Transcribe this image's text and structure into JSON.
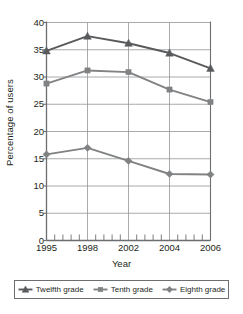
{
  "chart_data": {
    "type": "line",
    "title": "",
    "xlabel": "Year",
    "ylabel": "Percentage of users",
    "categories": [
      "1995",
      "1998",
      "2002",
      "2004",
      "2006"
    ],
    "x": [
      1995,
      1998,
      2002,
      2004,
      2006
    ],
    "xlim": [
      1995,
      2006
    ],
    "ylim": [
      0,
      40
    ],
    "yticks": [
      40,
      35,
      30,
      25,
      20,
      15,
      10,
      5,
      0
    ],
    "ytick_labels": [
      "40",
      "35",
      "30",
      "25",
      "20",
      "15",
      "10",
      "5",
      "0"
    ],
    "xtick_labels": [
      "1995",
      "1998",
      "2002",
      "2004",
      "2006"
    ],
    "grid": "horizontal-and-vertical",
    "legend_position": "below-boxed",
    "series": [
      {
        "name": "Twelfth grade",
        "marker": "triangle",
        "color": "#595a5c",
        "values": [
          34.8,
          37.5,
          36.2,
          34.4,
          31.6
        ]
      },
      {
        "name": "Tenth grade",
        "marker": "square",
        "color": "#808284",
        "values": [
          28.8,
          31.2,
          30.9,
          27.7,
          25.4
        ]
      },
      {
        "name": "Eighth grade",
        "marker": "diamond",
        "color": "#808284",
        "values": [
          15.8,
          17.0,
          14.6,
          12.2,
          12.1
        ]
      }
    ]
  },
  "legend": {
    "entries": [
      {
        "label": "Twelfth grade",
        "marker": "triangle-marker-icon"
      },
      {
        "label": "Tenth grade",
        "marker": "square-marker-icon"
      },
      {
        "label": "Eighth grade",
        "marker": "diamond-marker-icon"
      }
    ]
  },
  "style": {
    "axis_color": "#6d6e71",
    "grid_color": "#939598",
    "text_color": "#231f20",
    "background": "#ffffff"
  }
}
